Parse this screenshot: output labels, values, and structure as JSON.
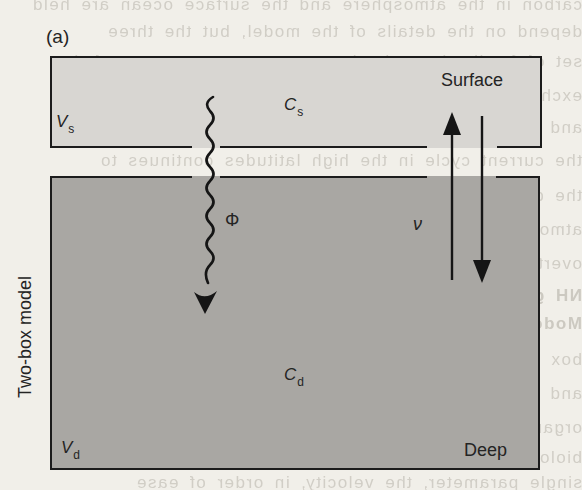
{
  "panel": {
    "tag": "(a)"
  },
  "side_label": "Two-box model",
  "surface_box": {
    "region_label": "Surface",
    "volume": {
      "main": "V",
      "sub": "s"
    },
    "concentration": {
      "main": "C",
      "sub": "s"
    },
    "fill": "#d8d6d2"
  },
  "deep_box": {
    "region_label": "Deep",
    "volume": {
      "main": "V",
      "sub": "d"
    },
    "concentration": {
      "main": "C",
      "sub": "d"
    },
    "fill": "#a9a7a3"
  },
  "arrows": {
    "particle_flux_symbol": "Φ",
    "exchange_symbol": "ν"
  },
  "colors": {
    "page_bg": "#f1efe9",
    "line": "#1c1c1c",
    "text": "#242424",
    "ghost": "#b7b3aa"
  },
  "ghost_bleedthrough": {
    "note": "faint mirrored print showing through from reverse page; mostly illegible",
    "lines": [
      {
        "y": -5,
        "bold": false,
        "text": "carbon in the atmosphere and the surface ocean are held"
      },
      {
        "y": 22,
        "bold": false,
        "text": "depend on the details of the model, but the three"
      },
      {
        "y": 52,
        "bold": false,
        "text": "set of feedback mechanisms prevents a runaway of the"
      },
      {
        "y": 86,
        "bold": false,
        "text": "exchange with the reservoir of the deep ocean and the"
      },
      {
        "y": 118,
        "bold": false,
        "text": "and sinking of particulate matter thereafter, during"
      },
      {
        "y": 151,
        "bold": false,
        "text": "the current cycle in the high latitudes continues to"
      },
      {
        "y": 186,
        "bold": false,
        "text": "the deep ocean returns to the surface on a timescale"
      },
      {
        "y": 220,
        "bold": false,
        "text": "atmosphere in contact with the surface mixed layer"
      },
      {
        "y": 254,
        "bold": false,
        "text": "overturning of the water masses at high latitudes"
      },
      {
        "y": 286,
        "bold": true,
        "text": "NH glacial records of the last maximum began item"
      },
      {
        "y": 314,
        "bold": true,
        "text": "Modeling the distribution of radiocarbon tracers"
      },
      {
        "y": 350,
        "bold": false,
        "text": "box models may be used to capture the essential"
      },
      {
        "y": 384,
        "bold": false,
        "text": "and total alkalinity in the surface water determines"
      },
      {
        "y": 418,
        "bold": false,
        "text": "organic matter falls from the euphotic zone and is"
      },
      {
        "y": 448,
        "bold": false,
        "text": "biological pumps are necessary in order to explain"
      },
      {
        "y": 473,
        "bold": false,
        "text": "single parameter, the velocity, in order of ease"
      }
    ]
  }
}
